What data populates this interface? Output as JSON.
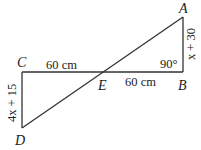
{
  "diagram": {
    "points": {
      "A": "A",
      "B": "B",
      "C": "C",
      "D": "D",
      "E": "E"
    },
    "labels": {
      "CE": "60 cm",
      "EB": "60 cm",
      "angle_B": "90°",
      "AB": "x + 30",
      "CD": "4x + 15"
    },
    "segments": [
      "AB",
      "CB",
      "CD",
      "AD"
    ]
  }
}
